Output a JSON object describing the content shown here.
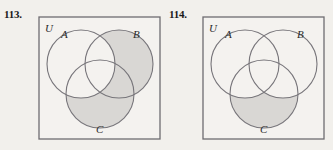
{
  "page": {
    "background_color": "#f2f0ec",
    "width": 333,
    "height": 150
  },
  "style": {
    "shade_color": "#d9d7d4",
    "stroke_color": "#77757a",
    "box_stroke_color": "#6e6c70",
    "box_fill_color": "#f4f2ef",
    "label_color": "#2b2b2b"
  },
  "exercises": [
    {
      "number": "113.",
      "universe_label": "U",
      "circle_labels": {
        "a": "A",
        "b": "B",
        "c": "C"
      },
      "shaded_description": "(B union C) minus A",
      "shaded_regions": [
        "B-only",
        "C-only",
        "B-and-C-only"
      ]
    },
    {
      "number": "114.",
      "universe_label": "U",
      "circle_labels": {
        "a": "A",
        "b": "B",
        "c": "C"
      },
      "shaded_description": "C minus (A union B)",
      "shaded_regions": [
        "C-only"
      ]
    }
  ]
}
